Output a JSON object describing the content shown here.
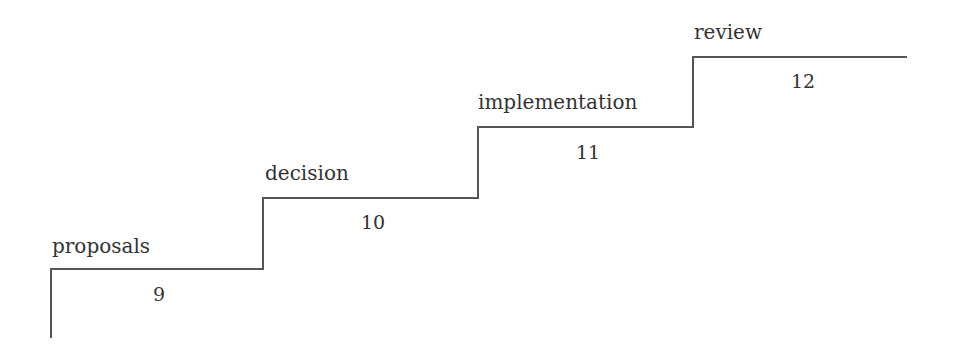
{
  "diagram": {
    "type": "staircase",
    "steps": [
      {
        "label": "proposals",
        "number": "9"
      },
      {
        "label": "decision",
        "number": "10"
      },
      {
        "label": "implementation",
        "number": "11"
      },
      {
        "label": "review",
        "number": "12"
      }
    ],
    "line_color": "#555555",
    "text_color": "#333333"
  }
}
